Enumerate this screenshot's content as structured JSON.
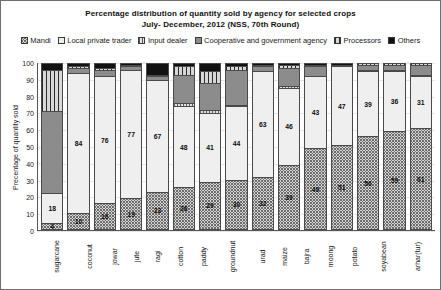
{
  "chart_data": {
    "type": "bar",
    "subtype": "stacked-100-percent",
    "title": "Percentage distribution of quantity sold by agency for selected crops",
    "subtitle": "July- December, 2012 (NSS, 70th Round)",
    "xlabel": "",
    "ylabel": "Precentage of quantity sold",
    "ylim": [
      0,
      100
    ],
    "yticks": [
      0,
      10,
      20,
      30,
      40,
      50,
      60,
      70,
      80,
      90,
      100
    ],
    "grid": false,
    "legend_position": "top",
    "categories": [
      "sugarcane",
      "coconut",
      "jowar",
      "jute",
      "ragi",
      "cotton",
      "paddy",
      "groundnut",
      "urad",
      "maize",
      "bajra",
      "moong",
      "potato",
      "soyabean",
      "arhar(tur)"
    ],
    "series": [
      {
        "name": "Mandi",
        "pattern": "p-mandi",
        "values": [
          4,
          10,
          16,
          19,
          23,
          26,
          29,
          30,
          32,
          39,
          49,
          51,
          56,
          59,
          61
        ],
        "labels": [
          "4",
          "10",
          "16",
          "19",
          "23",
          "26",
          "29",
          "30",
          "32",
          "39",
          "49",
          "51",
          "56",
          "59",
          "61"
        ]
      },
      {
        "name": "Local private trader",
        "pattern": "p-lpt",
        "values": [
          18,
          84,
          76,
          77,
          67,
          48,
          41,
          44,
          63,
          46,
          43,
          47,
          39,
          36,
          31
        ],
        "labels": [
          "18",
          "84",
          "76",
          "77",
          "67",
          "48",
          "41",
          "44",
          "63",
          "46",
          "43",
          "47",
          "39",
          "36",
          "31"
        ]
      },
      {
        "name": "Input dealer",
        "pattern": "p-input",
        "values": [
          0,
          0,
          0,
          0,
          0,
          2,
          2,
          1,
          0,
          1,
          0,
          0,
          1,
          1,
          1
        ],
        "labels": [
          "",
          "",
          "",
          "",
          "",
          "",
          "",
          "",
          "",
          "",
          "",
          "",
          "",
          "",
          ""
        ]
      },
      {
        "name": "Cooperative and government agency",
        "pattern": "p-coop",
        "values": [
          49,
          3,
          4,
          2,
          2,
          17,
          16,
          21,
          3,
          11,
          6,
          1,
          3,
          3,
          6
        ],
        "labels": [
          "",
          "",
          "",
          "",
          "",
          "",
          "",
          "",
          "",
          "",
          "",
          "",
          "",
          "",
          ""
        ]
      },
      {
        "name": "Processors",
        "pattern": "p-proc",
        "values": [
          25,
          1,
          1,
          1,
          1,
          5,
          7,
          2,
          1,
          2,
          1,
          0,
          1,
          1,
          1
        ],
        "labels": [
          "",
          "",
          "",
          "",
          "",
          "",
          "",
          "",
          "",
          "",
          "",
          "",
          "",
          "",
          ""
        ]
      },
      {
        "name": "Others",
        "pattern": "p-others",
        "values": [
          4,
          2,
          3,
          1,
          7,
          2,
          5,
          2,
          1,
          1,
          1,
          1,
          0,
          0,
          0
        ],
        "labels": [
          "",
          "",
          "",
          "",
          "",
          "",
          "",
          "",
          "",
          "",
          "",
          "",
          "",
          "",
          ""
        ]
      }
    ],
    "colors": {
      "mandi": "#d5d5d5",
      "local_private_trader": "#efefef",
      "input_dealer": "#e2e2e2",
      "cooperative_and_government_agency": "#8c8c8c",
      "processors": "#d8d8d8",
      "others": "#111111",
      "border": "#4a4a4a",
      "axis": "#555555",
      "text": "#111111",
      "background": "#ffffff"
    }
  }
}
